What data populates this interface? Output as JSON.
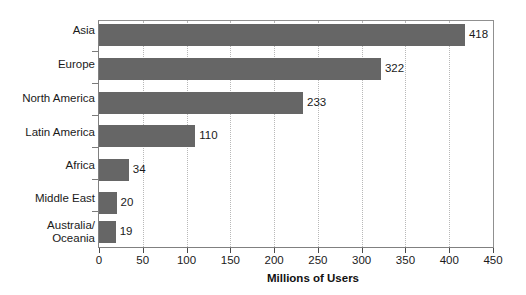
{
  "chart_data": {
    "type": "bar",
    "orientation": "horizontal",
    "title": "",
    "subtitle": "",
    "xlabel": "Millions of Users",
    "ylabel": "",
    "categories": [
      "Asia",
      "Europe",
      "North America",
      "Latin America",
      "Africa",
      "Middle East",
      "Australia/\nOceania"
    ],
    "values": [
      418,
      322,
      233,
      110,
      34,
      20,
      19
    ],
    "data_labels": [
      "418",
      "322",
      "233",
      "110",
      "34",
      "20",
      "19"
    ],
    "xlim": [
      0,
      450
    ],
    "ylim": [
      0,
      7
    ],
    "xticks": [
      0,
      50,
      100,
      150,
      200,
      250,
      300,
      350,
      400,
      450
    ],
    "xticklabels": [
      "0",
      "50",
      "100",
      "150",
      "200",
      "250",
      "300",
      "350",
      "400",
      "450"
    ],
    "grid": "vertical-dotted",
    "legend": "none",
    "bar_color": "#666666",
    "grid_color": "#b8b8b8",
    "axis_color": "#808080",
    "text_color": "#1a1a1a",
    "background": "#ffffff"
  }
}
